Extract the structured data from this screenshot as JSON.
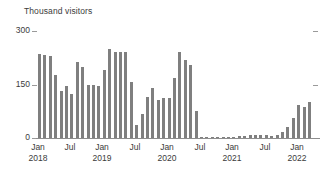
{
  "chart_data": {
    "type": "bar",
    "title": "",
    "axis_title": "Thousand visitors",
    "xlabel": "",
    "ylabel": "Thousand visitors",
    "ylim": [
      0,
      300
    ],
    "yticks": [
      0,
      150,
      300
    ],
    "ytick_labels": [
      "0",
      "150",
      "300"
    ],
    "grid": false,
    "legend": null,
    "bar_color": "#7f7f7f",
    "axis_color": "#8d8d8d",
    "text_color": "#3b3b3b",
    "xtick_labels": [
      {
        "month": "Jan",
        "year": "2018"
      },
      {
        "month": "Jul",
        "year": ""
      },
      {
        "month": "Jan",
        "year": "2019"
      },
      {
        "month": "Jul",
        "year": ""
      },
      {
        "month": "Jan",
        "year": "2020"
      },
      {
        "month": "Jul",
        "year": ""
      },
      {
        "month": "Jan",
        "year": "2021"
      },
      {
        "month": "Jul",
        "year": ""
      },
      {
        "month": "Jan",
        "year": "2022"
      }
    ],
    "categories": [
      "Jan 2018",
      "Feb 2018",
      "Mar 2018",
      "Apr 2018",
      "May 2018",
      "Jun 2018",
      "Jul 2018",
      "Aug 2018",
      "Sep 2018",
      "Oct 2018",
      "Nov 2018",
      "Dec 2018",
      "Jan 2019",
      "Feb 2019",
      "Mar 2019",
      "Apr 2019",
      "May 2019",
      "Jun 2019",
      "Jul 2019",
      "Aug 2019",
      "Sep 2019",
      "Oct 2019",
      "Nov 2019",
      "Dec 2019",
      "Jan 2020",
      "Feb 2020",
      "Mar 2020",
      "Apr 2020",
      "May 2020",
      "Jun 2020",
      "Jul 2020",
      "Aug 2020",
      "Sep 2020",
      "Oct 2020",
      "Nov 2020",
      "Dec 2020",
      "Jan 2021",
      "Feb 2021",
      "Mar 2021",
      "Apr 2021",
      "May 2021",
      "Jun 2021",
      "Jul 2021",
      "Aug 2021",
      "Sep 2021",
      "Oct 2021",
      "Nov 2021",
      "Dec 2021",
      "Jan 2022",
      "Feb 2022",
      "Mar 2022"
    ],
    "values": [
      232,
      230,
      228,
      175,
      130,
      144,
      122,
      212,
      196,
      147,
      148,
      145,
      188,
      248,
      238,
      240,
      240,
      155,
      36,
      68,
      115,
      140,
      105,
      110,
      112,
      168,
      240,
      218,
      202,
      75,
      2,
      1,
      1,
      1,
      1,
      1,
      3,
      5,
      6,
      7,
      8,
      8,
      7,
      6,
      9,
      18,
      30,
      55,
      92,
      85,
      100
    ],
    "units": "thousand visitors"
  }
}
